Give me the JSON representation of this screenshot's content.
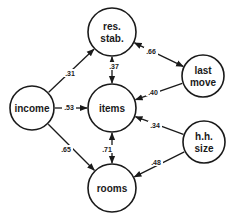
{
  "diagram": {
    "type": "path-diagram",
    "colors": {
      "stroke": "#1a1a1a",
      "background": "#ffffff"
    },
    "nodes": [
      {
        "id": "income",
        "lines": [
          "income"
        ],
        "cx": 32,
        "cy": 108,
        "r": 22
      },
      {
        "id": "res_stab",
        "lines": [
          "res.",
          "stab."
        ],
        "cx": 112,
        "cy": 32,
        "r": 24
      },
      {
        "id": "items",
        "lines": [
          "items"
        ],
        "cx": 112,
        "cy": 108,
        "r": 24
      },
      {
        "id": "rooms",
        "lines": [
          "rooms"
        ],
        "cx": 112,
        "cy": 188,
        "r": 24
      },
      {
        "id": "last_move",
        "lines": [
          "last",
          "move"
        ],
        "cx": 203,
        "cy": 76,
        "r": 21
      },
      {
        "id": "hh_size",
        "lines": [
          "h.h.",
          "size"
        ],
        "cx": 204,
        "cy": 142,
        "r": 21
      }
    ],
    "edges": [
      {
        "from": "income",
        "to": "res_stab",
        "label": ".31",
        "bidirectional": false,
        "lx": 70,
        "ly": 74
      },
      {
        "from": "income",
        "to": "items",
        "label": ".53",
        "bidirectional": false,
        "lx": 69,
        "ly": 108
      },
      {
        "from": "income",
        "to": "rooms",
        "label": ".65",
        "bidirectional": false,
        "lx": 66,
        "ly": 150
      },
      {
        "from": "res_stab",
        "to": "items",
        "label": ".37",
        "bidirectional": true,
        "lx": 114,
        "ly": 67
      },
      {
        "from": "res_stab",
        "to": "last_move",
        "label": ".66",
        "bidirectional": true,
        "lx": 151,
        "ly": 52
      },
      {
        "from": "last_move",
        "to": "items",
        "label": ".40",
        "bidirectional": false,
        "lx": 153,
        "ly": 93
      },
      {
        "from": "hh_size",
        "to": "items",
        "label": ".34",
        "bidirectional": false,
        "lx": 155,
        "ly": 126
      },
      {
        "from": "hh_size",
        "to": "rooms",
        "label": ".48",
        "bidirectional": false,
        "lx": 156,
        "ly": 163
      },
      {
        "from": "items",
        "to": "rooms",
        "label": ".71",
        "bidirectional": true,
        "lx": 107,
        "ly": 150
      }
    ]
  }
}
